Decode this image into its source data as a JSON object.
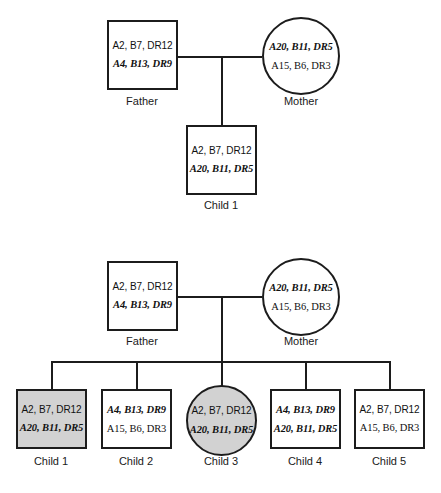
{
  "diagram": {
    "colors": {
      "line": "#1c1c1c",
      "shaded_fill": "#d2d2d2",
      "unshaded_fill": "#ffffff",
      "text": "#111111"
    }
  },
  "pedigree_1": {
    "father": {
      "label": "Father",
      "shape": "square",
      "shaded": false,
      "haplotype_top": "A2, B7, DR12",
      "haplotype_bottom": "A4, B13, DR9",
      "top_emphasis": "plain",
      "bottom_emphasis": "bold-italic"
    },
    "mother": {
      "label": "Mother",
      "shape": "circle",
      "shaded": false,
      "haplotype_top": "A20, B11, DR5",
      "haplotype_bottom": "A15, B6, DR3",
      "top_emphasis": "bold-italic",
      "bottom_emphasis": "plain"
    },
    "children": [
      {
        "label": "Child 1",
        "shape": "square",
        "shaded": false,
        "haplotype_top": "A2, B7, DR12",
        "haplotype_bottom": "A20, B11, DR5",
        "top_emphasis": "plain",
        "bottom_emphasis": "bold-italic"
      }
    ]
  },
  "pedigree_2": {
    "father": {
      "label": "Father",
      "shape": "square",
      "shaded": false,
      "haplotype_top": "A2, B7, DR12",
      "haplotype_bottom": "A4, B13, DR9",
      "top_emphasis": "plain",
      "bottom_emphasis": "bold-italic"
    },
    "mother": {
      "label": "Mother",
      "shape": "circle",
      "shaded": false,
      "haplotype_top": "A20, B11, DR5",
      "haplotype_bottom": "A15, B6, DR3",
      "top_emphasis": "bold-italic",
      "bottom_emphasis": "plain"
    },
    "children": [
      {
        "label": "Child 1",
        "shape": "square",
        "shaded": true,
        "haplotype_top": "A2, B7, DR12",
        "haplotype_bottom": "A20, B11, DR5",
        "top_emphasis": "plain",
        "bottom_emphasis": "bold-italic"
      },
      {
        "label": "Child 2",
        "shape": "square",
        "shaded": false,
        "haplotype_top": "A4, B13, DR9",
        "haplotype_bottom": "A15, B6, DR3",
        "top_emphasis": "bold-italic",
        "bottom_emphasis": "plain"
      },
      {
        "label": "Child 3",
        "shape": "circle",
        "shaded": true,
        "haplotype_top": "A2, B7, DR12",
        "haplotype_bottom": "A20, B11, DR5",
        "top_emphasis": "plain",
        "bottom_emphasis": "bold-italic"
      },
      {
        "label": "Child 4",
        "shape": "square",
        "shaded": false,
        "haplotype_top": "A4, B13, DR9",
        "haplotype_bottom": "A20, B11, DR5",
        "top_emphasis": "bold-italic",
        "bottom_emphasis": "bold-italic"
      },
      {
        "label": "Child 5",
        "shape": "square",
        "shaded": false,
        "haplotype_top": "A2, B7, DR12",
        "haplotype_bottom": "A15, B6, DR3",
        "top_emphasis": "plain",
        "bottom_emphasis": "plain"
      }
    ]
  }
}
